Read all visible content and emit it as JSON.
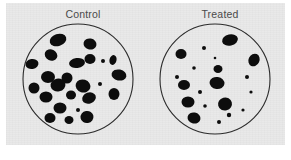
{
  "figure": {
    "background_color": "#ffffff",
    "panel_color": "#e9e9e9",
    "colony_color": "#0d0d0d",
    "dish_stroke_color": "#2b2b2b"
  },
  "dishes": [
    {
      "id": "control",
      "label": "Control",
      "colony_count": 24,
      "dish": {
        "cx": 58,
        "cy": 57,
        "r": 55
      }
    },
    {
      "id": "treated",
      "label": "Treated",
      "colony_count": 20,
      "dish": {
        "cx": 58,
        "cy": 57,
        "r": 55
      }
    }
  ],
  "chart_data": {
    "type": "scatter",
    "title": "",
    "xlabel": "",
    "ylabel": "",
    "panels": [
      {
        "name": "Control",
        "dish_radius": 55,
        "dish_center": [
          58,
          57
        ],
        "colony_count": 24,
        "total_colony_area_fraction": 0.14,
        "colonies": [
          {
            "x": 38,
            "y": 18,
            "rx": 8.5,
            "ry": 6.0,
            "rot": -18
          },
          {
            "x": 70,
            "y": 22,
            "rx": 6.5,
            "ry": 5.5,
            "rot": 10
          },
          {
            "x": 31,
            "y": 33,
            "rx": 6.5,
            "ry": 5.5,
            "rot": 25
          },
          {
            "x": 12,
            "y": 42,
            "rx": 6.5,
            "ry": 5.0,
            "rot": -10
          },
          {
            "x": 57,
            "y": 41,
            "rx": 8.0,
            "ry": 5.0,
            "rot": -8
          },
          {
            "x": 70,
            "y": 37,
            "rx": 5.5,
            "ry": 5.0,
            "rot": 0
          },
          {
            "x": 83,
            "y": 39,
            "rx": 2.0,
            "ry": 2.0,
            "rot": 0
          },
          {
            "x": 93,
            "y": 38,
            "rx": 3.5,
            "ry": 5.0,
            "rot": 15
          },
          {
            "x": 28,
            "y": 55,
            "rx": 7.0,
            "ry": 6.0,
            "rot": 0
          },
          {
            "x": 47,
            "y": 56,
            "rx": 5.5,
            "ry": 5.5,
            "rot": 0
          },
          {
            "x": 99,
            "y": 53,
            "rx": 7.5,
            "ry": 5.5,
            "rot": 12
          },
          {
            "x": 14,
            "y": 66,
            "rx": 5.5,
            "ry": 5.5,
            "rot": 0
          },
          {
            "x": 38,
            "y": 63,
            "rx": 7.5,
            "ry": 6.5,
            "rot": -12
          },
          {
            "x": 63,
            "y": 64,
            "rx": 7.5,
            "ry": 6.5,
            "rot": 18
          },
          {
            "x": 80,
            "y": 62,
            "rx": 2.0,
            "ry": 2.0,
            "rot": 0
          },
          {
            "x": 26,
            "y": 75,
            "rx": 6.5,
            "ry": 5.5,
            "rot": 0
          },
          {
            "x": 51,
            "y": 73,
            "rx": 5.0,
            "ry": 4.5,
            "rot": 0
          },
          {
            "x": 69,
            "y": 76,
            "rx": 7.0,
            "ry": 5.5,
            "rot": -20
          },
          {
            "x": 94,
            "y": 72,
            "rx": 5.5,
            "ry": 6.0,
            "rot": 0
          },
          {
            "x": 40,
            "y": 86,
            "rx": 6.5,
            "ry": 5.5,
            "rot": 0
          },
          {
            "x": 58,
            "y": 88,
            "rx": 2.0,
            "ry": 2.0,
            "rot": 0
          },
          {
            "x": 30,
            "y": 96,
            "rx": 5.5,
            "ry": 5.0,
            "rot": 0
          },
          {
            "x": 49,
            "y": 98,
            "rx": 4.5,
            "ry": 4.0,
            "rot": 0
          },
          {
            "x": 67,
            "y": 95,
            "rx": 6.5,
            "ry": 6.0,
            "rot": -10
          }
        ]
      },
      {
        "name": "Treated",
        "dish_radius": 55,
        "dish_center": [
          58,
          57
        ],
        "colony_count": 20,
        "total_colony_area_fraction": 0.05,
        "colonies": [
          {
            "x": 73,
            "y": 18,
            "rx": 8.0,
            "ry": 5.5,
            "rot": -12
          },
          {
            "x": 24,
            "y": 32,
            "rx": 5.5,
            "ry": 5.0,
            "rot": 0
          },
          {
            "x": 47,
            "y": 26,
            "rx": 2.0,
            "ry": 2.0,
            "rot": 0
          },
          {
            "x": 58,
            "y": 36,
            "rx": 1.3,
            "ry": 1.3,
            "rot": 0
          },
          {
            "x": 97,
            "y": 38,
            "rx": 5.5,
            "ry": 6.5,
            "rot": 25
          },
          {
            "x": 37,
            "y": 46,
            "rx": 1.8,
            "ry": 1.8,
            "rot": 0
          },
          {
            "x": 61,
            "y": 47,
            "rx": 4.5,
            "ry": 4.0,
            "rot": 0
          },
          {
            "x": 20,
            "y": 55,
            "rx": 2.0,
            "ry": 2.0,
            "rot": 0
          },
          {
            "x": 90,
            "y": 55,
            "rx": 2.0,
            "ry": 2.0,
            "rot": 0
          },
          {
            "x": 27,
            "y": 63,
            "rx": 6.0,
            "ry": 5.0,
            "rot": 0
          },
          {
            "x": 60,
            "y": 61,
            "rx": 7.5,
            "ry": 6.0,
            "rot": 8
          },
          {
            "x": 43,
            "y": 70,
            "rx": 2.0,
            "ry": 2.0,
            "rot": 0
          },
          {
            "x": 94,
            "y": 70,
            "rx": 1.6,
            "ry": 1.6,
            "rot": 0
          },
          {
            "x": 31,
            "y": 80,
            "rx": 6.5,
            "ry": 5.5,
            "rot": 0
          },
          {
            "x": 68,
            "y": 82,
            "rx": 7.0,
            "ry": 6.5,
            "rot": -15
          },
          {
            "x": 48,
            "y": 84,
            "rx": 1.8,
            "ry": 1.8,
            "rot": 0
          },
          {
            "x": 86,
            "y": 88,
            "rx": 1.6,
            "ry": 1.6,
            "rot": 0
          },
          {
            "x": 37,
            "y": 96,
            "rx": 6.5,
            "ry": 5.5,
            "rot": 10
          },
          {
            "x": 62,
            "y": 100,
            "rx": 2.0,
            "ry": 2.0,
            "rot": 0
          },
          {
            "x": 72,
            "y": 93,
            "rx": 2.2,
            "ry": 2.2,
            "rot": 0
          }
        ]
      }
    ]
  }
}
